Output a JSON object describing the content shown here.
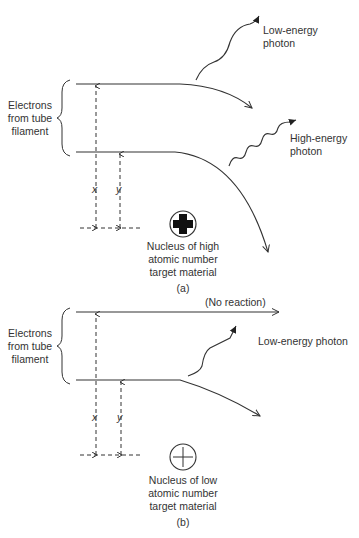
{
  "colors": {
    "stroke": "#333333",
    "text": "#333333",
    "background": "#ffffff"
  },
  "panel_a": {
    "caption": "(a)",
    "electrons_label": [
      "Electrons",
      "from tube",
      "filament"
    ],
    "low_photon_label": [
      "Low-energy",
      "photon"
    ],
    "high_photon_label": [
      "High-energy",
      "photon"
    ],
    "x_label": "x",
    "y_label": "y",
    "nucleus_label": [
      "Nucleus of high",
      "atomic number",
      "target material"
    ],
    "nucleus_icon": "plus-bold-circle-icon"
  },
  "panel_b": {
    "caption": "(b)",
    "electrons_label": [
      "Electrons",
      "from tube",
      "filament"
    ],
    "no_reaction_label": "(No reaction)",
    "low_photon_label": "Low-energy photon",
    "x_label": "x",
    "y_label": "y",
    "nucleus_label": [
      "Nucleus of low",
      "atomic number",
      "target material"
    ],
    "nucleus_icon": "plus-thin-circle-icon"
  }
}
